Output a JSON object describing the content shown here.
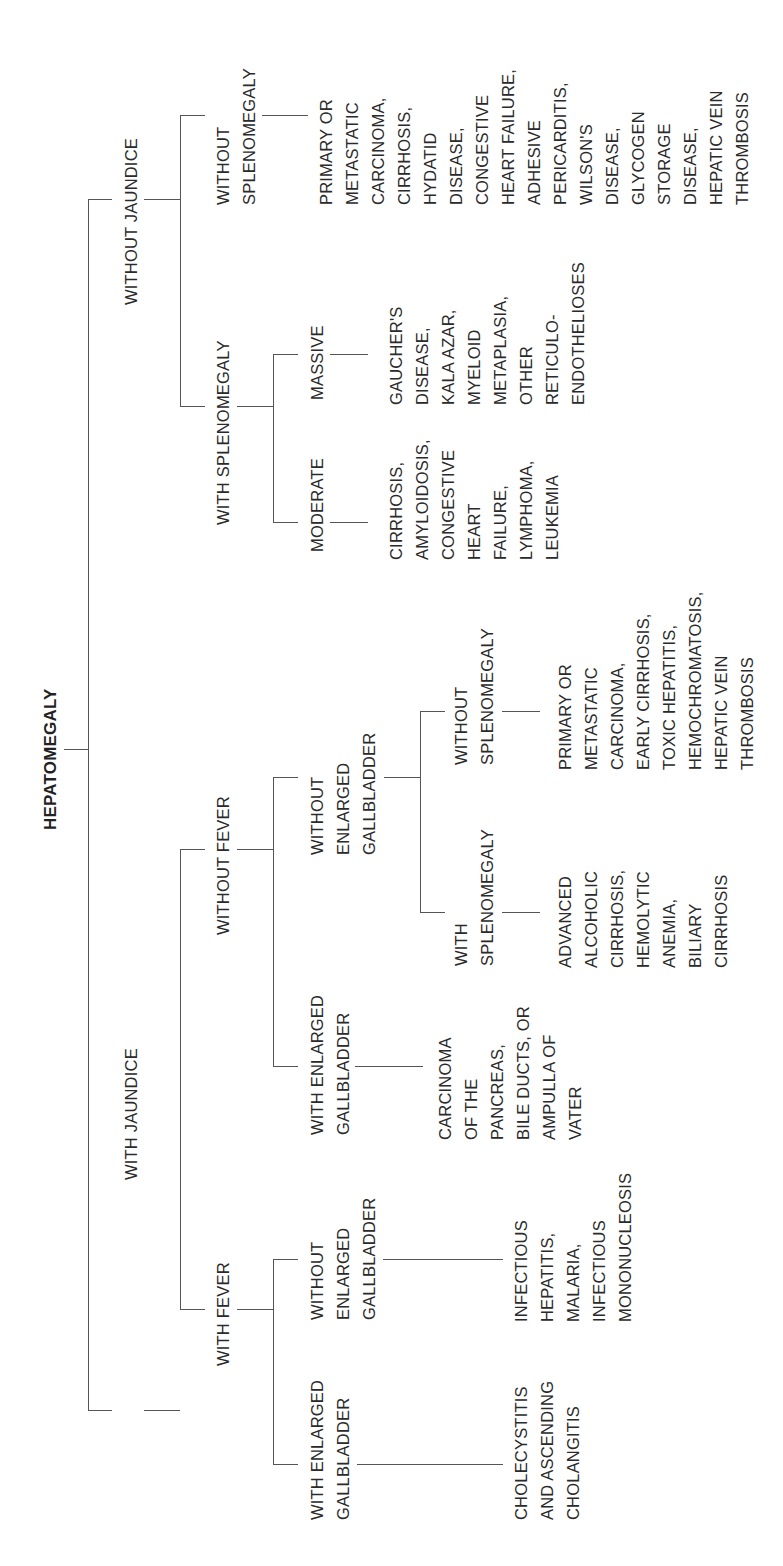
{
  "title": "HEPATOMEGALY",
  "branches": {
    "with_jaundice": {
      "label": "WITH JAUNDICE",
      "with_fever": {
        "label": "WITH FEVER",
        "with_enlarged_gb": {
          "label": "WITH ENLARGED\nGALLBLADDER",
          "causes": "CHOLECYSTITIS\nAND ASCENDING\nCHOLANGITIS"
        },
        "without_enlarged_gb": {
          "label": "WITHOUT\nENLARGED\nGALLBLADDER",
          "causes": "INFECTIOUS\nHEPATITIS,\nMALARIA,\nINFECTIOUS\nMONONUCLEOSIS"
        }
      },
      "without_fever": {
        "label": "WITHOUT FEVER",
        "with_enlarged_gb": {
          "label": "WITH ENLARGED\nGALLBLADDER",
          "causes": "CARCINOMA\nOF THE\nPANCREAS,\nBILE DUCTS, OR\nAMPULLA OF\nVATER"
        },
        "without_enlarged_gb": {
          "label": "WITHOUT\nENLARGED\nGALLBLADDER",
          "with_splenomegaly": {
            "label": "WITH\nSPLENOMEGALY",
            "causes": "ADVANCED\nALCOHOLIC\nCIRRHOSIS,\nHEMOLYTIC\nANEMIA,\nBILIARY\nCIRRHOSIS"
          },
          "without_splenomegaly": {
            "label": "WITHOUT\nSPLENOMEGALY",
            "causes": "PRIMARY OR\nMETASTATIC\nCARCINOMA,\nEARLY CIRRHOSIS,\nTOXIC HEPATITIS,\nHEMOCHROMATOSIS,\nHEPATIC VEIN\nTHROMBOSIS"
          }
        }
      }
    },
    "without_jaundice": {
      "label": "WITHOUT JAUNDICE",
      "with_splenomegaly": {
        "label": "WITH SPLENOMEGALY",
        "moderate": {
          "label": "MODERATE",
          "causes": "CIRRHOSIS,\nAMYLOIDOSIS,\nCONGESTIVE\nHEART\nFAILURE,\nLYMPHOMA,\nLEUKEMIA"
        },
        "massive": {
          "label": "MASSIVE",
          "causes": "GAUCHER'S\nDISEASE,\nKALA AZAR,\nMYELOID\nMETAPLASIA,\nOTHER\nRETICULO-\nENDOTHELIOSES"
        }
      },
      "without_splenomegaly": {
        "label": "WITHOUT\nSPLENOMEGALY",
        "causes": "PRIMARY OR\nMETASTATIC\nCARCINOMA,\nCIRRHOSIS,\nHYDATID\nDISEASE,\nCONGESTIVE\nHEART FAILURE,\nADHESIVE\nPERICARDITIS,\nWILSON'S\nDISEASE,\nGLYCOGEN\nSTORAGE\nDISEASE,\nHEPATIC VEIN\nTHROMBOSIS"
      }
    }
  },
  "colors": {
    "line": "#555555",
    "text": "#2a2a2a",
    "background": "#ffffff"
  }
}
